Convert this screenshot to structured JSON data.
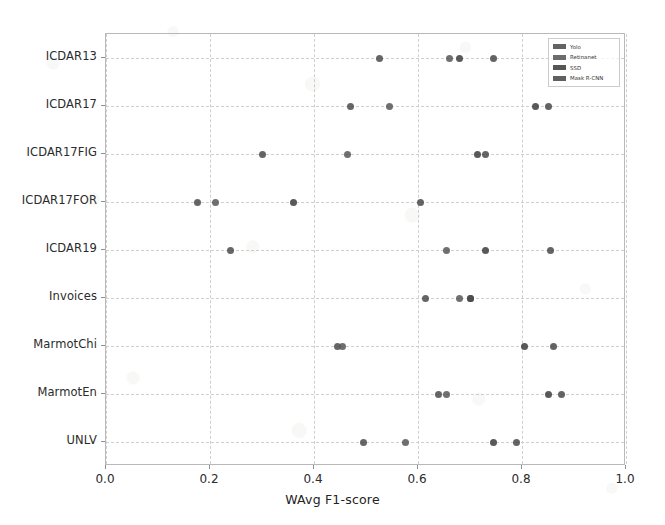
{
  "chart_data": {
    "type": "scatter",
    "title": "",
    "xlabel": "WAvg F1-score",
    "ylabel": "",
    "xlim": [
      0.0,
      1.0
    ],
    "xticks": [
      "0.0",
      "0.2",
      "0.4",
      "0.6",
      "0.8",
      "1.0"
    ],
    "xtick_values": [
      0.0,
      0.2,
      0.4,
      0.6,
      0.8,
      1.0
    ],
    "grid": true,
    "legend_position": "upper right",
    "categories": [
      "ICDAR13",
      "ICDAR17",
      "ICDAR17FIG",
      "ICDAR17FOR",
      "ICDAR19",
      "Invoices",
      "MarmotChi",
      "MarmotEn",
      "UNLV"
    ],
    "series": [
      {
        "name": "Yolo",
        "color": "#4d4d4d",
        "values": [
          0.525,
          0.47,
          0.3,
          0.175,
          0.24,
          0.615,
          0.445,
          0.64,
          0.495
        ]
      },
      {
        "name": "Retinanet",
        "color": "#585858",
        "values": [
          0.66,
          0.545,
          0.465,
          0.21,
          0.655,
          0.68,
          0.455,
          0.655,
          0.575
        ]
      },
      {
        "name": "SSD",
        "color": "#3f3f3f",
        "values": [
          0.68,
          0.825,
          0.715,
          0.36,
          0.73,
          0.7,
          0.805,
          0.85,
          0.745
        ]
      },
      {
        "name": "Mask R-CNN",
        "color": "#4a4a4a",
        "values": [
          0.745,
          0.85,
          0.73,
          0.605,
          0.855,
          0.7,
          0.86,
          0.875,
          0.79
        ]
      }
    ]
  },
  "legend": {
    "entries": [
      {
        "label": "Yolo"
      },
      {
        "label": "Retinanet"
      },
      {
        "label": "SSD"
      },
      {
        "label": "Mask R-CNN"
      }
    ]
  },
  "axes": {
    "x_label": "WAvg F1-score"
  }
}
